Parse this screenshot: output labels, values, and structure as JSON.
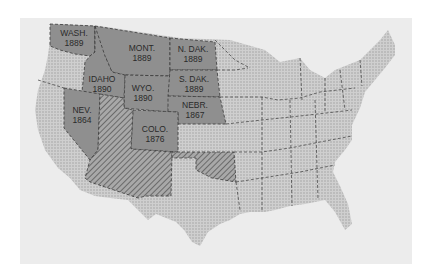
{
  "map": {
    "type": "thematic map of the United States",
    "legend_semantics": {
      "admitted_state": "dark gray fill, labeled with name and year of statehood",
      "territory": "diagonal hatched fill",
      "other_states": "light stippled fill"
    },
    "colors": {
      "background": "#ffffff",
      "frame": "#ececec",
      "admitted": "#8f8f8f",
      "other": "#c8c8c8",
      "hatch": "#6e6e6e",
      "border": "#3a3a3a"
    },
    "labeled_states": [
      {
        "name": "WASH.",
        "year": "1889"
      },
      {
        "name": "MONT.",
        "year": "1889"
      },
      {
        "name": "N. DAK.",
        "year": "1889"
      },
      {
        "name": "IDAHO",
        "year": "1890"
      },
      {
        "name": "WYO.",
        "year": "1890"
      },
      {
        "name": "S. DAK.",
        "year": "1889"
      },
      {
        "name": "NEV.",
        "year": "1864"
      },
      {
        "name": "NEBR.",
        "year": "1867"
      },
      {
        "name": "COLO.",
        "year": "1876"
      }
    ],
    "hatched_regions": [
      "Utah/Arizona/New Mexico territory",
      "Oklahoma/Indian territory"
    ]
  }
}
